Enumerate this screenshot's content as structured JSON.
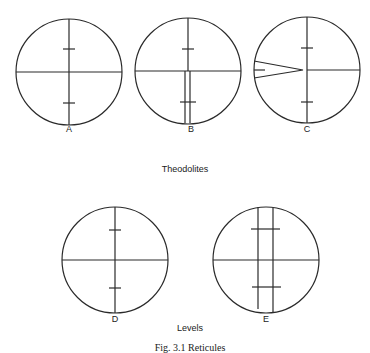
{
  "groups": [
    {
      "caption": "Theodolites",
      "reticules": [
        {
          "label": "A",
          "type": "single-vertical-stadia"
        },
        {
          "label": "B",
          "type": "double-lower-vertical-stadia"
        },
        {
          "label": "C",
          "type": "wedge-horizontal-stadia"
        }
      ]
    },
    {
      "caption": "Levels",
      "reticules": [
        {
          "label": "D",
          "type": "single-vertical-stadia"
        },
        {
          "label": "E",
          "type": "double-vertical-stadia"
        }
      ]
    }
  ],
  "figure_caption": "Fig. 3.1 Reticules",
  "colors": {
    "line": "#2a2a2a",
    "background": "#ffffff"
  }
}
